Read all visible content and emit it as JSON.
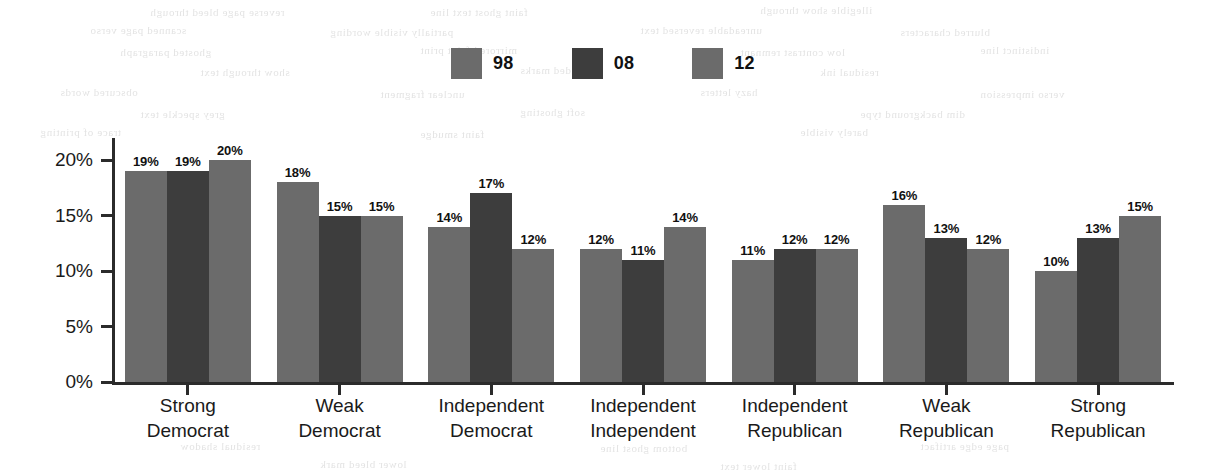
{
  "chart_data": {
    "type": "bar",
    "title": "",
    "subtitle": "",
    "xlabel": "",
    "ylabel": "",
    "ylim": [
      0,
      22
    ],
    "grid": false,
    "legend_position": "top-center",
    "value_suffix": "%",
    "categories": [
      "Strong\nDemocrat",
      "Weak\nDemocrat",
      "Independent\nDemocrat",
      "Independent\nIndependent",
      "Independent\nRepublican",
      "Weak\nRepublican",
      "Strong\nRepublican"
    ],
    "category_lines": [
      [
        "Strong",
        "Democrat"
      ],
      [
        "Weak",
        "Democrat"
      ],
      [
        "Independent",
        "Democrat"
      ],
      [
        "Independent",
        "Independent"
      ],
      [
        "Independent",
        "Republican"
      ],
      [
        "Weak",
        "Republican"
      ],
      [
        "Strong",
        "Republican"
      ]
    ],
    "series": [
      {
        "name": "98",
        "color": "#6b6b6b",
        "values": [
          19,
          18,
          14,
          12,
          11,
          16,
          10
        ],
        "labels": [
          "19%",
          "18%",
          "14%",
          "12%",
          "11%",
          "16%",
          "10%"
        ]
      },
      {
        "name": "08",
        "color": "#3d3d3d",
        "values": [
          19,
          15,
          17,
          11,
          12,
          13,
          13
        ],
        "labels": [
          "19%",
          "15%",
          "17%",
          "11%",
          "12%",
          "13%",
          "13%"
        ]
      },
      {
        "name": "12",
        "color": "#6b6b6b",
        "values": [
          20,
          15,
          12,
          14,
          12,
          12,
          15
        ],
        "labels": [
          "20%",
          "15%",
          "12%",
          "14%",
          "12%",
          "12%",
          "15%"
        ]
      }
    ],
    "yticks": [
      {
        "value": 0,
        "label": "0%"
      },
      {
        "value": 5,
        "label": "5%"
      },
      {
        "value": 10,
        "label": "10%"
      },
      {
        "value": 15,
        "label": "15%"
      },
      {
        "value": 20,
        "label": "20%"
      }
    ]
  },
  "legend": {
    "items": [
      {
        "label": "98",
        "color": "#6b6b6b"
      },
      {
        "label": "08",
        "color": "#3d3d3d"
      },
      {
        "label": "12",
        "color": "#6b6b6b"
      }
    ]
  },
  "axis": {
    "line_color": "#2b2b2b"
  },
  "background_artifacts": [
    {
      "text": "reverse page bleed through",
      "x": 150,
      "y": 6
    },
    {
      "text": "faint ghost text line",
      "x": 430,
      "y": 6
    },
    {
      "text": "illegible show through",
      "x": 760,
      "y": 4
    },
    {
      "text": "scanned page verso",
      "x": 90,
      "y": 24
    },
    {
      "text": "partially visible wording",
      "x": 330,
      "y": 26
    },
    {
      "text": "unreadable reversed text",
      "x": 640,
      "y": 24
    },
    {
      "text": "blurred characters",
      "x": 900,
      "y": 26
    },
    {
      "text": "ghosted paragraph",
      "x": 120,
      "y": 46
    },
    {
      "text": "mirrored faint print",
      "x": 420,
      "y": 44
    },
    {
      "text": "low contrast remnant",
      "x": 740,
      "y": 46
    },
    {
      "text": "indistinct line",
      "x": 980,
      "y": 44
    },
    {
      "text": "show through text",
      "x": 200,
      "y": 66
    },
    {
      "text": "faded marks",
      "x": 520,
      "y": 64
    },
    {
      "text": "residual ink",
      "x": 820,
      "y": 66
    },
    {
      "text": "obscured words",
      "x": 60,
      "y": 86
    },
    {
      "text": "unclear fragment",
      "x": 380,
      "y": 88
    },
    {
      "text": "hazy letters",
      "x": 700,
      "y": 86
    },
    {
      "text": "verso impression",
      "x": 980,
      "y": 88
    },
    {
      "text": "grey speckle text",
      "x": 140,
      "y": 108
    },
    {
      "text": "soft ghosting",
      "x": 520,
      "y": 106
    },
    {
      "text": "dim background type",
      "x": 860,
      "y": 108
    },
    {
      "text": "trace of printing",
      "x": 40,
      "y": 126
    },
    {
      "text": "faint smudge",
      "x": 420,
      "y": 128
    },
    {
      "text": "barely visible",
      "x": 800,
      "y": 126
    },
    {
      "text": "residual shadow",
      "x": 180,
      "y": 440
    },
    {
      "text": "bottom ghost line",
      "x": 600,
      "y": 442
    },
    {
      "text": "page edge artifact",
      "x": 920,
      "y": 440
    },
    {
      "text": "lower bleed mark",
      "x": 320,
      "y": 458
    },
    {
      "text": "faint lower text",
      "x": 720,
      "y": 460
    }
  ]
}
